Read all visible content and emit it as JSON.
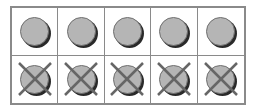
{
  "diagram": {
    "type": "ten-frame",
    "rows": 2,
    "columns": 5,
    "colors": {
      "border": "#8a8a8a",
      "counter_fill": "#b5b5b5",
      "counter_shadow": "#2a2a2a",
      "cross": "#666666"
    },
    "cells": [
      {
        "row": 0,
        "col": 0,
        "content": "counter",
        "crossed": false
      },
      {
        "row": 0,
        "col": 1,
        "content": "counter",
        "crossed": false
      },
      {
        "row": 0,
        "col": 2,
        "content": "counter",
        "crossed": false
      },
      {
        "row": 0,
        "col": 3,
        "content": "counter",
        "crossed": false
      },
      {
        "row": 0,
        "col": 4,
        "content": "counter",
        "crossed": false
      },
      {
        "row": 1,
        "col": 0,
        "content": "counter",
        "crossed": true
      },
      {
        "row": 1,
        "col": 1,
        "content": "counter",
        "crossed": true
      },
      {
        "row": 1,
        "col": 2,
        "content": "counter",
        "crossed": true
      },
      {
        "row": 1,
        "col": 3,
        "content": "counter",
        "crossed": true
      },
      {
        "row": 1,
        "col": 4,
        "content": "counter",
        "crossed": true
      }
    ],
    "counts": {
      "total_counters": 10,
      "crossed_out": 5,
      "remaining": 5
    }
  }
}
